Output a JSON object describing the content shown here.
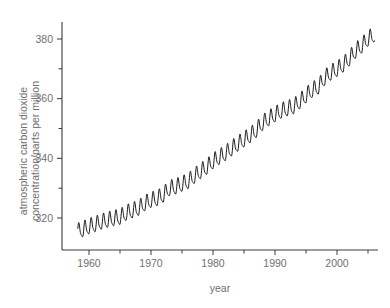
{
  "chart_data": {
    "type": "line",
    "title": "",
    "xlabel": "year",
    "ylabel": "atmospheric carbon dioxide concentration/parts per million",
    "ylabel_line1": "atmospheric carbon dioxide",
    "ylabel_line2": "concentration/parts per million",
    "xlim": [
      1957.5,
      2007.0
    ],
    "ylim": [
      311.0,
      383.0
    ],
    "grid": false,
    "legend": null,
    "x_major_ticks": [
      1960,
      1970,
      1980,
      1990,
      2000
    ],
    "x_major_tick_labels": [
      "1960",
      "1970",
      "1980",
      "1990",
      "2000"
    ],
    "x_minor_ticks": [
      1965,
      1975,
      1985,
      1995,
      2005
    ],
    "y_major_ticks": [
      320,
      340,
      360,
      380
    ],
    "y_major_tick_labels": [
      "320",
      "340",
      "360",
      "380"
    ],
    "y_minor_ticks": [
      330,
      350,
      370
    ],
    "series": [
      {
        "name": "Mauna Loa monthly mean CO2",
        "units": "parts per million",
        "x": [
          1958.2,
          1959.0,
          1960.0,
          1961.0,
          1962.0,
          1963.0,
          1964.0,
          1965.0,
          1966.0,
          1967.0,
          1968.0,
          1969.0,
          1970.0,
          1971.0,
          1972.0,
          1973.0,
          1974.0,
          1975.0,
          1976.0,
          1977.0,
          1978.0,
          1979.0,
          1980.0,
          1981.0,
          1982.0,
          1983.0,
          1984.0,
          1985.0,
          1986.0,
          1987.0,
          1988.0,
          1989.0,
          1990.0,
          1991.0,
          1992.0,
          1993.0,
          1994.0,
          1995.0,
          1996.0,
          1997.0,
          1998.0,
          1999.0,
          2000.0,
          2001.0,
          2002.0,
          2003.0,
          2004.0,
          2005.0,
          2006.0
        ],
        "annual_mean": [
          315.3,
          315.9,
          316.9,
          317.6,
          318.4,
          319.0,
          319.6,
          320.0,
          321.4,
          322.2,
          323.0,
          324.6,
          325.7,
          326.3,
          327.5,
          329.7,
          330.2,
          331.1,
          332.0,
          333.8,
          335.4,
          336.8,
          338.7,
          340.1,
          341.4,
          343.0,
          344.6,
          346.0,
          347.4,
          349.2,
          351.6,
          353.1,
          354.4,
          355.6,
          356.4,
          357.1,
          358.8,
          360.8,
          362.6,
          363.7,
          366.7,
          368.4,
          369.6,
          371.1,
          373.2,
          375.8,
          377.5,
          379.8,
          381.2
        ],
        "seasonal_amplitude_ppm": 6.0,
        "seasonal_peak_month": "May",
        "seasonal_trough_month": "September",
        "color": "#1a1a1a",
        "style": "solid",
        "linewidth": 1.0
      }
    ]
  }
}
